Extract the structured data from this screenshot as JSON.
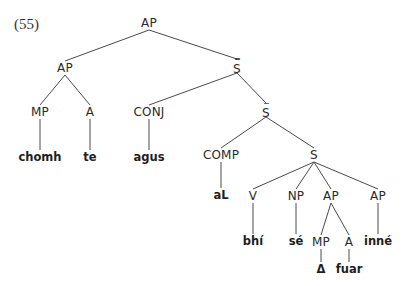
{
  "example_number": "(55)",
  "colors": {
    "line": "#4a4a4a",
    "text": "#2a2a2a",
    "background": "#ffffff"
  },
  "nodes": {
    "root_ap": {
      "label": "AP",
      "x": 149,
      "y": 23
    },
    "ap_left": {
      "label": "AP",
      "x": 65,
      "y": 68
    },
    "s_double_bar": {
      "label": "S",
      "bars": "=",
      "x": 237,
      "y": 66
    },
    "mp_1": {
      "label": "MP",
      "x": 40,
      "y": 112
    },
    "a_1": {
      "label": "A",
      "x": 90,
      "y": 112
    },
    "conj": {
      "label": "CONJ",
      "x": 149,
      "y": 112
    },
    "s_bar": {
      "label": "S",
      "bars": "-",
      "x": 266,
      "y": 110
    },
    "comp": {
      "label": "COMP",
      "x": 221,
      "y": 155
    },
    "s": {
      "label": "S",
      "x": 314,
      "y": 155
    },
    "v": {
      "label": "V",
      "x": 253,
      "y": 196
    },
    "np": {
      "label": "NP",
      "x": 296,
      "y": 196
    },
    "ap_mid": {
      "label": "AP",
      "x": 331,
      "y": 196
    },
    "ap_right": {
      "label": "AP",
      "x": 378,
      "y": 196
    },
    "mp_2": {
      "label": "MP",
      "x": 321,
      "y": 242
    },
    "a_2": {
      "label": "A",
      "x": 349,
      "y": 242
    }
  },
  "leaves": {
    "chomh": {
      "text": "chomh",
      "x": 40,
      "y": 158
    },
    "te": {
      "text": "te",
      "x": 90,
      "y": 158
    },
    "agus": {
      "text": "agus",
      "x": 149,
      "y": 158
    },
    "aL": {
      "text": "aL",
      "x": 221,
      "y": 196
    },
    "bhi": {
      "text": "bhí",
      "x": 253,
      "y": 242
    },
    "se": {
      "text": "sé",
      "x": 296,
      "y": 242
    },
    "inne": {
      "text": "inné",
      "x": 378,
      "y": 242
    },
    "delta": {
      "text": "Δ",
      "x": 321,
      "y": 270
    },
    "fuar": {
      "text": "fuar",
      "x": 349,
      "y": 270
    }
  },
  "edges": [
    [
      "root_ap",
      "ap_left"
    ],
    [
      "root_ap",
      "s_double_bar"
    ],
    [
      "ap_left",
      "mp_1"
    ],
    [
      "ap_left",
      "a_1"
    ],
    [
      "s_double_bar",
      "conj"
    ],
    [
      "s_double_bar",
      "s_bar"
    ],
    [
      "mp_1",
      "chomh"
    ],
    [
      "a_1",
      "te"
    ],
    [
      "conj",
      "agus"
    ],
    [
      "s_bar",
      "comp"
    ],
    [
      "s_bar",
      "s"
    ],
    [
      "comp",
      "aL"
    ],
    [
      "s",
      "v"
    ],
    [
      "s",
      "np"
    ],
    [
      "s",
      "ap_mid"
    ],
    [
      "s",
      "ap_right"
    ],
    [
      "v",
      "bhi"
    ],
    [
      "np",
      "se"
    ],
    [
      "ap_mid",
      "mp_2"
    ],
    [
      "ap_mid",
      "a_2"
    ],
    [
      "ap_right",
      "inne"
    ],
    [
      "mp_2",
      "delta"
    ],
    [
      "a_2",
      "fuar"
    ]
  ]
}
